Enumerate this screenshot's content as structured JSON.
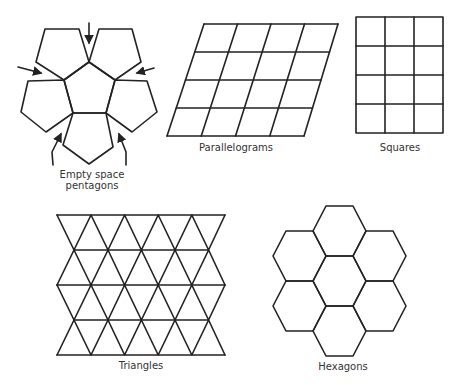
{
  "figure": {
    "panels": [
      {
        "id": "pentagons",
        "label_line1": "Empty space",
        "label_line2": "pentagons"
      },
      {
        "id": "parallelograms",
        "label": "Parallelograms"
      },
      {
        "id": "squares",
        "label": "Squares"
      },
      {
        "id": "triangles",
        "label": "Triangles"
      },
      {
        "id": "hexagons",
        "label": "Hexagons"
      }
    ],
    "colors": {
      "stroke": "#222222",
      "background": "#ffffff",
      "text": "#333333"
    }
  }
}
